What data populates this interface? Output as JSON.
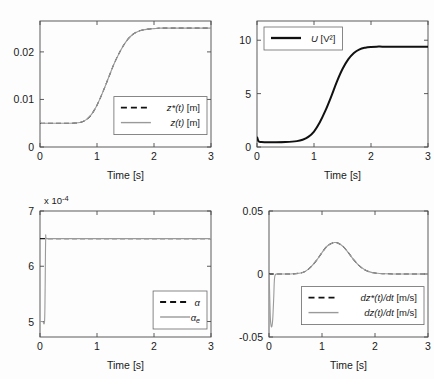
{
  "figure": {
    "title": "",
    "layout": "2x2 subplot grid",
    "background": "#ffffff"
  },
  "chart_data": [
    {
      "id": "position",
      "type": "line",
      "title": "",
      "xlabel": "Time [s]",
      "ylabel": "",
      "xlim": [
        0,
        3
      ],
      "ylim": [
        0,
        0.0265
      ],
      "xticks": [
        0,
        1,
        2,
        3
      ],
      "xticklabels": [
        "0",
        "1",
        "2",
        "3"
      ],
      "yticks": [
        0,
        0.01,
        0.02
      ],
      "yticklabels": [
        "0",
        "0.01",
        "0.02"
      ],
      "grid": false,
      "legend_position": "center-right",
      "multiplier_label": "",
      "series": [
        {
          "name": "z*(t) [m]",
          "style": "dashed",
          "color": "#111111",
          "x": [
            0,
            0.1,
            0.2,
            0.3,
            0.4,
            0.5,
            0.6,
            0.7,
            0.8,
            0.9,
            1.0,
            1.1,
            1.2,
            1.3,
            1.4,
            1.5,
            1.6,
            1.7,
            1.8,
            1.9,
            2.0,
            2.1,
            2.2,
            2.4,
            2.6,
            2.8,
            3.0
          ],
          "y": [
            0.005,
            0.005,
            0.005,
            0.005,
            0.005,
            0.005,
            0.00502,
            0.00515,
            0.00565,
            0.0068,
            0.0088,
            0.0115,
            0.0145,
            0.0175,
            0.02,
            0.022,
            0.0234,
            0.0242,
            0.0246,
            0.0248,
            0.0249,
            0.025,
            0.025,
            0.025,
            0.025,
            0.025,
            0.025
          ]
        },
        {
          "name": "z(t) [m]",
          "style": "solid",
          "color": "#9a9a9a",
          "x": [
            0,
            0.02,
            0.05,
            0.1,
            0.2,
            0.3,
            0.4,
            0.5,
            0.6,
            0.7,
            0.8,
            0.9,
            1.0,
            1.1,
            1.2,
            1.3,
            1.4,
            1.5,
            1.6,
            1.7,
            1.8,
            1.9,
            2.0,
            2.1,
            2.2,
            2.4,
            2.6,
            2.8,
            3.0
          ],
          "y": [
            0.0057,
            0.005,
            0.00495,
            0.00498,
            0.005,
            0.005,
            0.005,
            0.005,
            0.00502,
            0.00515,
            0.00565,
            0.0068,
            0.0088,
            0.0115,
            0.0145,
            0.0175,
            0.02,
            0.022,
            0.0234,
            0.0242,
            0.0246,
            0.0248,
            0.0249,
            0.025,
            0.025,
            0.025,
            0.025,
            0.025,
            0.025
          ]
        }
      ]
    },
    {
      "id": "control-effort",
      "type": "line",
      "title": "",
      "xlabel": "Time [s]",
      "ylabel": "",
      "xlim": [
        0,
        3
      ],
      "ylim": [
        0,
        11.8
      ],
      "xticks": [
        0,
        1,
        2,
        3
      ],
      "xticklabels": [
        "0",
        "1",
        "2",
        "3"
      ],
      "yticks": [
        0,
        5,
        10
      ],
      "yticklabels": [
        "0",
        "5",
        "10"
      ],
      "grid": false,
      "legend_position": "top-left",
      "multiplier_label": "",
      "series": [
        {
          "name": "U [V²]",
          "style": "thick",
          "color": "#111111",
          "x": [
            0,
            0.03,
            0.08,
            0.15,
            0.3,
            0.5,
            0.7,
            0.8,
            0.9,
            1.0,
            1.1,
            1.2,
            1.3,
            1.4,
            1.5,
            1.6,
            1.7,
            1.8,
            1.9,
            2.0,
            2.1,
            2.2,
            2.4,
            2.6,
            2.8,
            3.0
          ],
          "y": [
            0.95,
            0.52,
            0.46,
            0.45,
            0.45,
            0.47,
            0.55,
            0.68,
            0.95,
            1.45,
            2.3,
            3.4,
            4.7,
            6.1,
            7.3,
            8.2,
            8.8,
            9.15,
            9.3,
            9.37,
            9.4,
            9.4,
            9.4,
            9.4,
            9.4,
            9.4
          ]
        }
      ]
    },
    {
      "id": "parameter-estimate",
      "type": "line",
      "title": "",
      "xlabel": "Time [s]",
      "ylabel": "",
      "xlim": [
        0,
        3
      ],
      "ylim": [
        4.72,
        7.0
      ],
      "xticks": [
        0,
        1,
        2,
        3
      ],
      "xticklabels": [
        "0",
        "1",
        "2",
        "3"
      ],
      "yticks": [
        5,
        6,
        7
      ],
      "yticklabels": [
        "5",
        "6",
        "7"
      ],
      "grid": false,
      "legend_position": "bottom-right",
      "multiplier_label": "x 10",
      "multiplier_exponent": "-4",
      "series": [
        {
          "name": "α",
          "style": "dashed",
          "color": "#111111",
          "x": [
            0,
            0.5,
            1.0,
            1.5,
            2.0,
            2.5,
            3.0
          ],
          "y": [
            6.5,
            6.5,
            6.5,
            6.5,
            6.5,
            6.5,
            6.5
          ]
        },
        {
          "name": "αe",
          "style": "solid",
          "color": "#9a9a9a",
          "x": [
            0,
            0.02,
            0.05,
            0.08,
            0.09,
            0.1,
            0.12,
            0.3,
            0.6,
            1.0,
            1.5,
            2.0,
            2.5,
            3.0
          ],
          "y": [
            5.0,
            5.0,
            5.0,
            5.0,
            5.6,
            6.5,
            6.5,
            6.5,
            6.5,
            6.5,
            6.5,
            6.5,
            6.5,
            6.5
          ]
        }
      ]
    },
    {
      "id": "velocity",
      "type": "line",
      "title": "",
      "xlabel": "Time [s]",
      "ylabel": "",
      "xlim": [
        0,
        3
      ],
      "ylim": [
        -0.05,
        0.05
      ],
      "xticks": [
        0,
        1,
        2,
        3
      ],
      "xticklabels": [
        "0",
        "1",
        "2",
        "3"
      ],
      "yticks": [
        -0.05,
        0,
        0.05
      ],
      "yticklabels": [
        "-0.05",
        "0",
        "0.05"
      ],
      "grid": false,
      "legend_position": "center-right",
      "multiplier_label": "",
      "series": [
        {
          "name": "dz*(t)/dt [m/s]",
          "style": "dashed",
          "color": "#111111",
          "x": [
            0,
            0.2,
            0.4,
            0.6,
            0.7,
            0.8,
            0.9,
            1.0,
            1.1,
            1.2,
            1.25,
            1.3,
            1.4,
            1.5,
            1.6,
            1.7,
            1.8,
            1.9,
            2.0,
            2.2,
            2.5,
            3.0
          ],
          "y": [
            0,
            0,
            0,
            0.0008,
            0.0025,
            0.006,
            0.011,
            0.017,
            0.0222,
            0.0247,
            0.025,
            0.0246,
            0.0218,
            0.0168,
            0.0112,
            0.0066,
            0.0035,
            0.0017,
            0.0008,
            0.0002,
            0.0,
            0.0
          ]
        },
        {
          "name": "dz(t)/dt [m/s]",
          "style": "solid",
          "color": "#9a9a9a",
          "x": [
            0,
            0.01,
            0.02,
            0.03,
            0.05,
            0.07,
            0.09,
            0.1,
            0.12,
            0.2,
            0.4,
            0.6,
            0.7,
            0.8,
            0.9,
            1.0,
            1.1,
            1.2,
            1.25,
            1.3,
            1.4,
            1.5,
            1.6,
            1.7,
            1.8,
            1.9,
            2.0,
            2.2,
            2.5,
            3.0
          ],
          "y": [
            0.0,
            -0.012,
            -0.028,
            -0.038,
            -0.042,
            -0.036,
            -0.018,
            -0.006,
            -0.0005,
            0.0,
            0.0,
            0.0008,
            0.0025,
            0.006,
            0.011,
            0.017,
            0.0222,
            0.0247,
            0.025,
            0.0246,
            0.0218,
            0.0168,
            0.0112,
            0.0066,
            0.0035,
            0.0017,
            0.0008,
            0.0002,
            0.0,
            0.0
          ]
        }
      ]
    }
  ],
  "panels": {
    "position": {
      "xlabel": "Time [s]",
      "legend": [
        {
          "label_main": "z*(t)",
          "label_unit": " [m]",
          "style": "dashed"
        },
        {
          "label_main": "z(t)",
          "label_unit": " [m]",
          "style": "solid"
        }
      ]
    },
    "control_effort": {
      "xlabel": "Time [s]",
      "legend": [
        {
          "label_main": "U",
          "label_unit": " [V²]",
          "style": "thick"
        }
      ]
    },
    "parameter_estimate": {
      "xlabel": "Time [s]",
      "multiplier": "x 10",
      "multiplier_exp": "-4",
      "legend": [
        {
          "label_main": "α",
          "label_unit": "",
          "style": "dashed"
        },
        {
          "label_main": "α",
          "label_sub": "e",
          "label_unit": "",
          "style": "solid"
        }
      ]
    },
    "velocity": {
      "xlabel": "Time [s]",
      "legend": [
        {
          "label_main": "dz*(t)/dt",
          "label_unit": " [m/s]",
          "style": "dashed"
        },
        {
          "label_main": "dz(t)/dt",
          "label_unit": " [m/s]",
          "style": "solid"
        }
      ]
    }
  }
}
